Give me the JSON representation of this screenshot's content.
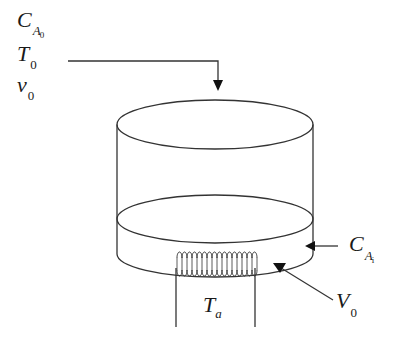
{
  "diagram": {
    "type": "reactor-schematic",
    "feed_labels": [
      {
        "symbol": "C",
        "subscript": "A",
        "sub_subscript": "0"
      },
      {
        "symbol": "T",
        "subscript": "0"
      },
      {
        "symbol": "v",
        "subscript": "0"
      }
    ],
    "concentration_label": {
      "symbol": "C",
      "subscript": "A",
      "sub_subscript": "i"
    },
    "volume_label": {
      "symbol": "V",
      "subscript": "0"
    },
    "heater_label": {
      "symbol": "T",
      "subscript": "a"
    },
    "stroke_color": "#333333",
    "background": "#ffffff"
  }
}
